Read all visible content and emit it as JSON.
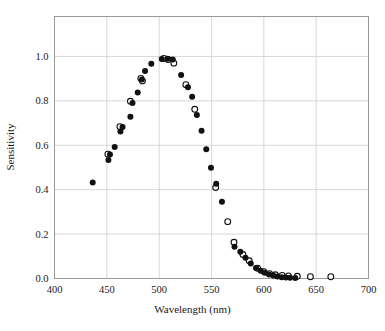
{
  "chart_data": {
    "type": "scatter",
    "title": "",
    "xlabel": "Wavelength (nm)",
    "ylabel": "Sensitivity",
    "xlim": [
      400,
      700
    ],
    "ylim": [
      0.0,
      1.18
    ],
    "xticks": [
      400,
      450,
      500,
      550,
      600,
      650,
      700
    ],
    "xticklabels": [
      "400",
      "450",
      "500",
      "550",
      "600",
      "650",
      "700"
    ],
    "yticks": [
      0.0,
      0.2,
      0.4,
      0.6,
      0.8,
      1.0
    ],
    "yticklabels": [
      "0.0",
      "0.2",
      "0.4",
      "0.6",
      "0.8",
      "1.0"
    ],
    "grid": true,
    "grid_color": "#cfcfcf",
    "frame_color": "#9a9a9a",
    "legend": "none",
    "series": [
      {
        "name": "filled-circles",
        "marker": "filled-circle",
        "color": "#111111",
        "points": [
          {
            "x": 436.5,
            "y": 0.432
          },
          {
            "x": 451.5,
            "y": 0.534
          },
          {
            "x": 453.0,
            "y": 0.558
          },
          {
            "x": 457.5,
            "y": 0.592
          },
          {
            "x": 463.0,
            "y": 0.662
          },
          {
            "x": 465.0,
            "y": 0.682
          },
          {
            "x": 472.5,
            "y": 0.729
          },
          {
            "x": 474.5,
            "y": 0.79
          },
          {
            "x": 479.5,
            "y": 0.838
          },
          {
            "x": 483.5,
            "y": 0.896
          },
          {
            "x": 486.5,
            "y": 0.935
          },
          {
            "x": 492.5,
            "y": 0.967
          },
          {
            "x": 502.5,
            "y": 0.989
          },
          {
            "x": 508.0,
            "y": 0.99
          },
          {
            "x": 513.0,
            "y": 0.986
          },
          {
            "x": 521.0,
            "y": 0.916
          },
          {
            "x": 527.5,
            "y": 0.861
          },
          {
            "x": 531.5,
            "y": 0.819
          },
          {
            "x": 536.0,
            "y": 0.736
          },
          {
            "x": 540.5,
            "y": 0.665
          },
          {
            "x": 545.0,
            "y": 0.582
          },
          {
            "x": 549.5,
            "y": 0.499
          },
          {
            "x": 554.5,
            "y": 0.427
          },
          {
            "x": 560.0,
            "y": 0.346
          },
          {
            "x": 572.0,
            "y": 0.143
          },
          {
            "x": 577.5,
            "y": 0.121
          },
          {
            "x": 582.5,
            "y": 0.094
          },
          {
            "x": 587.5,
            "y": 0.068
          },
          {
            "x": 592.5,
            "y": 0.047
          },
          {
            "x": 597.0,
            "y": 0.035
          },
          {
            "x": 601.0,
            "y": 0.026
          },
          {
            "x": 605.0,
            "y": 0.018
          },
          {
            "x": 609.0,
            "y": 0.013
          },
          {
            "x": 613.0,
            "y": 0.009
          },
          {
            "x": 617.0,
            "y": 0.006
          },
          {
            "x": 621.0,
            "y": 0.004
          },
          {
            "x": 625.0,
            "y": 0.003
          },
          {
            "x": 630.0,
            "y": 0.002
          }
        ]
      },
      {
        "name": "open-circles",
        "marker": "open-circle",
        "color": "#111111",
        "points": [
          {
            "x": 451.0,
            "y": 0.56
          },
          {
            "x": 462.5,
            "y": 0.684
          },
          {
            "x": 472.5,
            "y": 0.798
          },
          {
            "x": 482.5,
            "y": 0.901
          },
          {
            "x": 484.0,
            "y": 0.89
          },
          {
            "x": 504.5,
            "y": 0.991
          },
          {
            "x": 508.5,
            "y": 0.986
          },
          {
            "x": 514.0,
            "y": 0.97
          },
          {
            "x": 525.5,
            "y": 0.873
          },
          {
            "x": 534.0,
            "y": 0.762
          },
          {
            "x": 554.0,
            "y": 0.41
          },
          {
            "x": 565.5,
            "y": 0.256
          },
          {
            "x": 571.5,
            "y": 0.163
          },
          {
            "x": 580.0,
            "y": 0.108
          },
          {
            "x": 586.0,
            "y": 0.08
          },
          {
            "x": 594.0,
            "y": 0.046
          },
          {
            "x": 600.0,
            "y": 0.031
          },
          {
            "x": 605.5,
            "y": 0.022
          },
          {
            "x": 611.0,
            "y": 0.017
          },
          {
            "x": 617.5,
            "y": 0.014
          },
          {
            "x": 623.5,
            "y": 0.012
          },
          {
            "x": 632.0,
            "y": 0.01
          },
          {
            "x": 644.5,
            "y": 0.008
          },
          {
            "x": 664.0,
            "y": 0.008
          }
        ]
      }
    ]
  }
}
